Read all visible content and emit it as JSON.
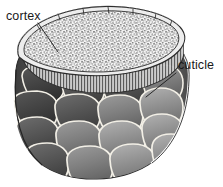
{
  "figure": {
    "kind": "anatomical-illustration",
    "background_color": "#ffffff",
    "ink_color": "#1a1a1a",
    "width": 223,
    "height": 187
  },
  "labels": [
    {
      "id": "cortex",
      "text": "cortex",
      "x": 6,
      "y": 20,
      "leader": {
        "from_x": 38,
        "from_y": 23,
        "to_x": 58,
        "to_y": 52
      }
    },
    {
      "id": "cuticle",
      "text": "cuticle",
      "x": 178,
      "y": 69,
      "leader": {
        "from_x": 176,
        "from_y": 73,
        "to_x": 146,
        "to_y": 97
      }
    }
  ],
  "regions": {
    "cortex": {
      "name": "cortex",
      "description": "stippled granular elliptical cut surface",
      "fill_color": "#f4f4f4",
      "stipple_color": "#8a8a8a",
      "outline_color": "#333333"
    },
    "cuticle": {
      "name": "cuticle",
      "description": "overlapping scale plates forming the outer sheath",
      "scale_light": "#9a9a9a",
      "scale_mid": "#7d7d7d",
      "scale_dark": "#4e4e4e",
      "scale_shadow": "#3a3a3a",
      "scale_edge_highlight": "#f2efe6",
      "rim_highlight": "#ffffff"
    },
    "cut_edge": {
      "name": "cut-edge-band",
      "description": "thin vertically striated band at the cut rim beneath the cortex",
      "fill_color": "#d8d8d8",
      "stripe_color": "#4a4a4a"
    }
  },
  "colors": {
    "background": "#ffffff",
    "ink": "#1a1a1a",
    "highlight": "#f2efe6",
    "shadow": "#3a3a3a"
  }
}
